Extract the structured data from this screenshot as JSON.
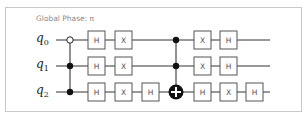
{
  "diagram": {
    "type": "quantum-circuit",
    "global_phase_label": "Global Phase: π",
    "qubits": [
      {
        "name": "q",
        "index": "0"
      },
      {
        "name": "q",
        "index": "1"
      },
      {
        "name": "q",
        "index": "2"
      }
    ],
    "operations": [
      {
        "column": 1,
        "type": "CCX",
        "controls": [
          {
            "qubit": 0,
            "state": "open"
          },
          {
            "qubit": 1,
            "state": "closed"
          }
        ],
        "target": 2,
        "note": "drawn as controls q0(open), q1, q2 dots"
      },
      {
        "column": 2,
        "gates": [
          {
            "qubit": 0,
            "label": "H"
          },
          {
            "qubit": 1,
            "label": "H"
          },
          {
            "qubit": 2,
            "label": "H"
          }
        ]
      },
      {
        "column": 3,
        "gates": [
          {
            "qubit": 0,
            "label": "X"
          },
          {
            "qubit": 1,
            "label": "X"
          },
          {
            "qubit": 2,
            "label": "X"
          }
        ]
      },
      {
        "column": 4,
        "gates": [
          {
            "qubit": 2,
            "label": "H"
          }
        ]
      },
      {
        "column": 5,
        "type": "CCX",
        "controls": [
          0,
          1
        ],
        "target": 2
      },
      {
        "column": 6,
        "gates": [
          {
            "qubit": 0,
            "label": "X"
          },
          {
            "qubit": 1,
            "label": "X"
          },
          {
            "qubit": 2,
            "label": "H"
          }
        ]
      },
      {
        "column": 7,
        "gates": [
          {
            "qubit": 0,
            "label": "H"
          },
          {
            "qubit": 1,
            "label": "H"
          },
          {
            "qubit": 2,
            "label": "X"
          }
        ]
      },
      {
        "column": 8,
        "gates": [
          {
            "qubit": 2,
            "label": "H"
          }
        ]
      }
    ],
    "labels": {
      "h": "H",
      "x": "X"
    }
  }
}
